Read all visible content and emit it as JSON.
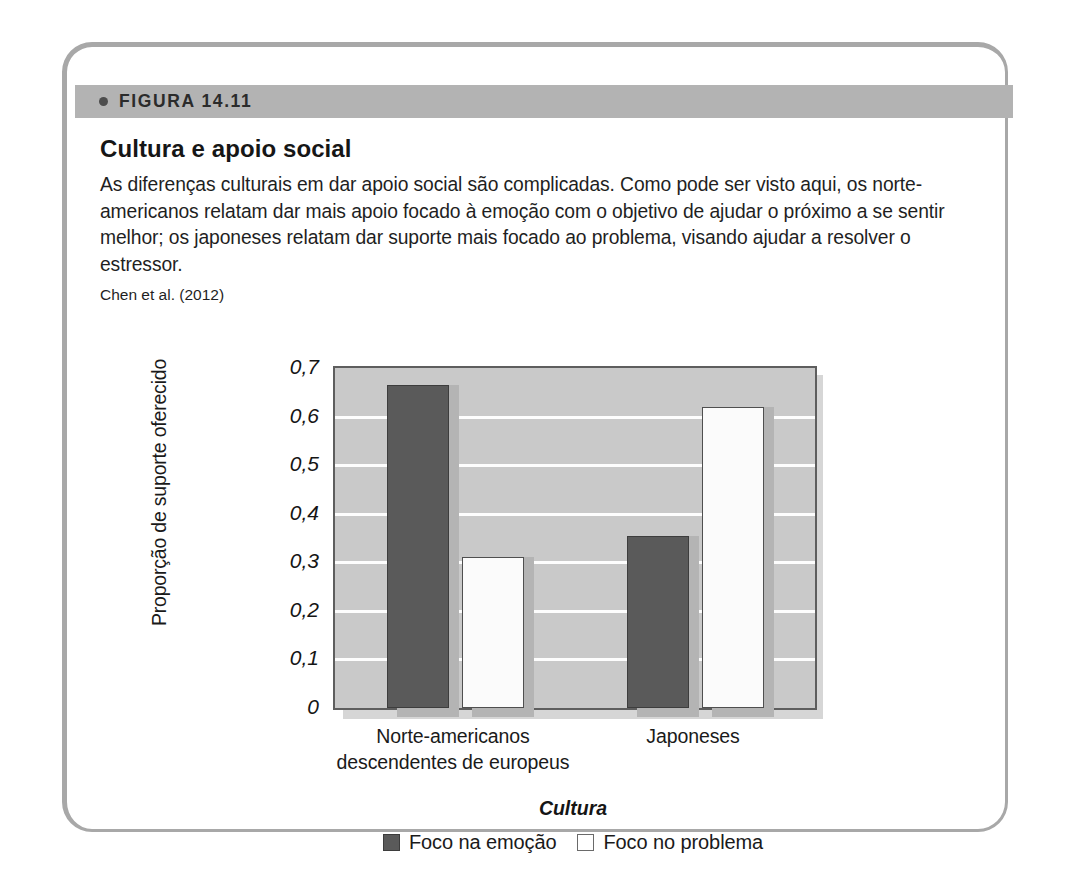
{
  "figure": {
    "header_label": "FIGURA 14.11",
    "title": "Cultura e apoio social",
    "description": "As diferenças culturais em dar apoio social são complicadas. Como pode ser visto aqui, os norte-americanos relatam dar mais apoio focado à emoção com o objetivo de ajudar o próximo a se sentir melhor; os japoneses relatam dar suporte mais focado ao problema, visando ajudar a resolver o estressor.",
    "source": "Chen et al. (2012)"
  },
  "colors": {
    "frame_border": "#a8a8a8",
    "header_band": "#b3b3b3",
    "plot_background": "#c9c9c9",
    "gridline": "#fdfdfd",
    "bar_dark": "#5a5a5a",
    "bar_light": "#fbfbfb",
    "shadow": "#d6d6d6"
  },
  "chart_data": {
    "type": "bar",
    "title": "Cultura e apoio social",
    "xlabel": "Cultura",
    "ylabel": "Proporção de suporte oferecido",
    "categories": [
      "Norte-americanos descendentes de europeus",
      "Japoneses"
    ],
    "category_lines": [
      [
        "Norte-americanos",
        "descendentes de europeus"
      ],
      [
        "Japoneses"
      ]
    ],
    "series": [
      {
        "name": "Foco na emoção",
        "values": [
          0.665,
          0.354
        ],
        "color": "#5a5a5a"
      },
      {
        "name": "Foco no problema",
        "values": [
          0.311,
          0.62
        ],
        "color": "#fbfbfb"
      }
    ],
    "ylim": [
      0,
      0.7
    ],
    "ytick_values": [
      0,
      0.1,
      0.2,
      0.3,
      0.4,
      0.5,
      0.6,
      0.7
    ],
    "ytick_labels": [
      "0",
      "0,1",
      "0,2",
      "0,3",
      "0,4",
      "0,5",
      "0,6",
      "0,7"
    ],
    "grid": true,
    "legend_position": "bottom",
    "legend": [
      "Foco na emoção",
      "Foco no problema"
    ]
  }
}
